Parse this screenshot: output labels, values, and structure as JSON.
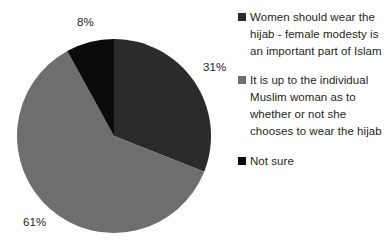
{
  "chart_data": {
    "type": "pie",
    "title": "",
    "subtitle": "",
    "xlabel": "",
    "ylabel": "",
    "grid": false,
    "legend_position": "right",
    "start_angle_deg": 0,
    "direction": "clockwise",
    "categories": [
      "Women should wear the hijab - female modesty is an important part of Islam",
      "It is up to the individual Muslim woman as to whether or not she chooses to wear the hijab",
      "Not sure"
    ],
    "values": [
      31,
      61,
      8
    ],
    "value_labels": [
      "31%",
      "61%",
      "8%"
    ],
    "unit": "%",
    "colors": [
      "#2b2b2b",
      "#6e6e6e",
      "#0b0b0b"
    ]
  },
  "legend": {
    "items": [
      {
        "label": "Women should wear the hijab - female modesty is an important part of Islam",
        "color": "#2b2b2b"
      },
      {
        "label": "It is up to the individual Muslim woman as to whether or not she chooses to wear the hijab",
        "color": "#6e6e6e"
      },
      {
        "label": "Not sure",
        "color": "#0b0b0b"
      }
    ]
  },
  "labels": {
    "slice_0": "31%",
    "slice_1": "61%",
    "slice_2": "8%"
  }
}
